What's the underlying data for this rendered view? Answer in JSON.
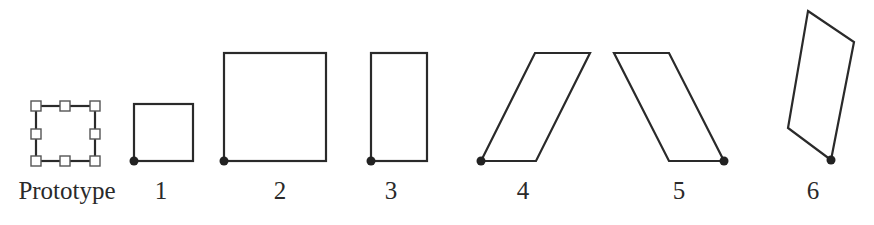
{
  "figure": {
    "stroke_color": "#2a2a2a",
    "handle_fill": "#ffffff",
    "handle_stroke": "#555555",
    "anchor_color": "#222222",
    "items": [
      {
        "id": "prototype",
        "label": "Prototype",
        "label_x": 67,
        "shape": "rectangle-with-selection-handles"
      },
      {
        "id": "1",
        "label": "1",
        "label_x": 161,
        "shape": "small-square",
        "anchor": "bottom-left"
      },
      {
        "id": "2",
        "label": "2",
        "label_x": 280,
        "shape": "scaled-square",
        "anchor": "bottom-left"
      },
      {
        "id": "3",
        "label": "3",
        "label_x": 391,
        "shape": "vertically-stretched-rectangle",
        "anchor": "bottom-left"
      },
      {
        "id": "4",
        "label": "4",
        "label_x": 523,
        "shape": "right-skewed-parallelogram",
        "anchor": "bottom-left"
      },
      {
        "id": "5",
        "label": "5",
        "label_x": 679,
        "shape": "left-skewed-parallelogram",
        "anchor": "bottom-right"
      },
      {
        "id": "6",
        "label": "6",
        "label_x": 813,
        "shape": "rotated-parallelogram",
        "anchor": "bottom"
      }
    ]
  }
}
